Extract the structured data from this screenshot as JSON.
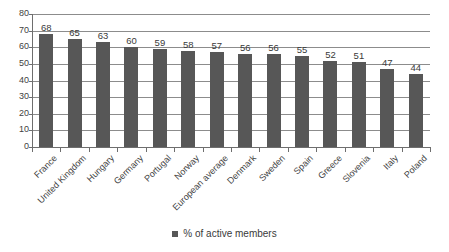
{
  "chart_data": {
    "type": "bar",
    "title": "",
    "subtitle": "",
    "xlabel": "",
    "ylabel": "",
    "ylim": [
      0,
      80
    ],
    "ytick_step": 10,
    "yticks": [
      "80",
      "70",
      "60",
      "50",
      "40",
      "30",
      "20",
      "10",
      "0"
    ],
    "grid": true,
    "legend_position": "bottom",
    "categories": [
      "France",
      "United Kingdom",
      "Hungary",
      "Germany",
      "Portugal",
      "Norway",
      "European average",
      "Denmark",
      "Sweden",
      "Spain",
      "Greece",
      "Slovenia",
      "Italy",
      "Poland"
    ],
    "values": [
      68,
      65,
      63,
      60,
      59,
      58,
      57,
      56,
      56,
      55,
      52,
      51,
      47,
      44
    ],
    "data_labels": [
      "68",
      "65",
      "63",
      "60",
      "59",
      "58",
      "57",
      "56",
      "56",
      "55",
      "52",
      "51",
      "47",
      "44"
    ],
    "series": [
      {
        "name": "% of active members",
        "values": [
          68,
          65,
          63,
          60,
          59,
          58,
          57,
          56,
          56,
          55,
          52,
          51,
          47,
          44
        ],
        "color": "#575757"
      }
    ]
  },
  "legend": {
    "entries": [
      {
        "label": "% of active members",
        "color": "#575757"
      }
    ]
  },
  "colors": {
    "bar": "#575757",
    "gridline": "#8c8c8c",
    "axis": "#6e6e6e",
    "text": "#3a3a3a",
    "background": "#ffffff"
  }
}
